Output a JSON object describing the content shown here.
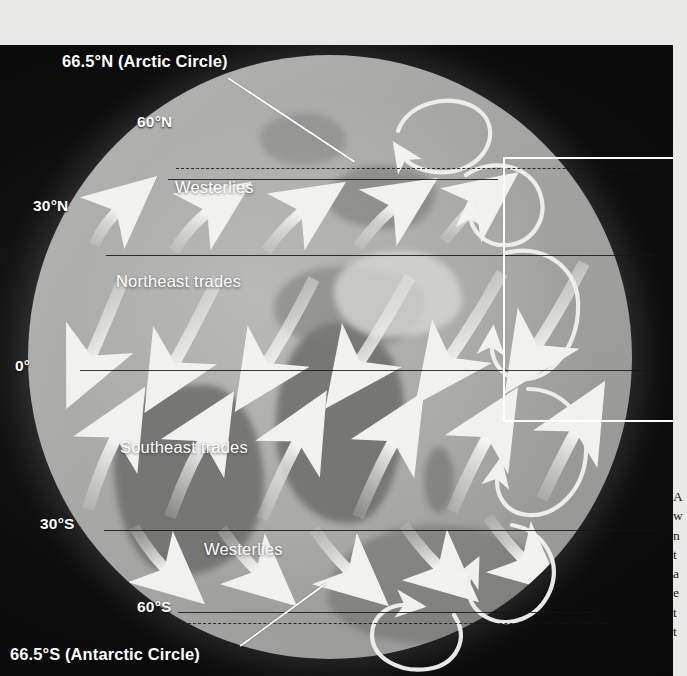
{
  "figure": {
    "kind": "globe-diagram",
    "title_present": false,
    "background_color": "#e8e8e6",
    "panel_color": "#0a0a0a",
    "globe_color": "#a3a3a1",
    "line_color": "#14140f",
    "label_color": "#ffffff",
    "highlight_color": "#ffffff"
  },
  "latitude_lines": [
    {
      "id": "arctic-circle",
      "label": "66.5°N (Arctic Circle)",
      "style": "dashed",
      "y": 125,
      "callout": true
    },
    {
      "id": "lat-60n",
      "label": "60°N",
      "style": "solid",
      "y": 136,
      "callout": false
    },
    {
      "id": "lat-30n",
      "label": "30°N",
      "style": "solid",
      "y": 212,
      "callout": false
    },
    {
      "id": "lat-0",
      "label": "0°",
      "style": "solid",
      "y": 371,
      "callout": false
    },
    {
      "id": "lat-30s",
      "label": "30°S",
      "style": "solid",
      "y": 530,
      "callout": false
    },
    {
      "id": "lat-60s",
      "label": "60°S",
      "style": "solid",
      "y": 611,
      "callout": false
    },
    {
      "id": "antarctic-circle",
      "label": "66.5°S (Antarctic Circle)",
      "style": "dashed",
      "y": 621,
      "callout": true
    }
  ],
  "labels": {
    "arctic_circle": "66.5°N (Arctic Circle)",
    "lat_60n": "60°N",
    "lat_30n": "30°N",
    "lat_0": "0°",
    "lat_30s": "30°S",
    "lat_60s": "60°S",
    "antarctic_circle": "66.5°S (Antarctic Circle)"
  },
  "wind_belts": [
    {
      "id": "westerlies-north",
      "label": "Westerlies",
      "hemisphere": "north",
      "arrow_direction": "northeast",
      "band_top": 136,
      "band_bottom": 212
    },
    {
      "id": "northeast-trades",
      "label": "Northeast trades",
      "hemisphere": "north",
      "arrow_direction": "southwest",
      "band_top": 212,
      "band_bottom": 371
    },
    {
      "id": "southeast-trades",
      "label": "Southeast trades",
      "hemisphere": "south",
      "arrow_direction": "northwest",
      "band_top": 371,
      "band_bottom": 530
    },
    {
      "id": "westerlies-south",
      "label": "Westerlies",
      "hemisphere": "south",
      "arrow_direction": "southeast",
      "band_top": 530,
      "band_bottom": 611
    }
  ],
  "belt_label_text": {
    "westerlies_north": "Westerlies",
    "northeast_trades": "Northeast trades",
    "southeast_trades": "Southeast trades",
    "westerlies_south": "Westerlies"
  },
  "circulation_cells": [
    {
      "id": "polar-cell-north",
      "position": "north-limb-top",
      "rotation": "clockwise"
    },
    {
      "id": "ferrel-cell-north",
      "position": "north-limb-upper",
      "rotation": "counterclockwise"
    },
    {
      "id": "hadley-cell-north",
      "position": "north-limb-lower",
      "rotation": "clockwise"
    },
    {
      "id": "hadley-cell-south",
      "position": "south-limb-upper",
      "rotation": "counterclockwise"
    },
    {
      "id": "ferrel-cell-south",
      "position": "south-limb-lower",
      "rotation": "clockwise"
    },
    {
      "id": "polar-cell-south",
      "position": "south-limb-bottom",
      "rotation": "counterclockwise"
    }
  ],
  "callout_box": {
    "id": "detail-callout",
    "x": 503,
    "y": 157,
    "width": 184,
    "height": 261,
    "border_color": "#ffffff",
    "border_width": 3
  },
  "side_text": {
    "visible_fragment": "A\nw\nn\nt\na\ne\nt\nt"
  }
}
